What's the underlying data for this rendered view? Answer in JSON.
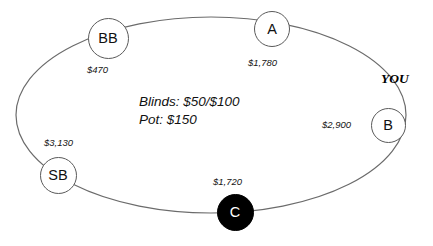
{
  "diagram": {
    "type": "poker-table",
    "background_color": "#ffffff",
    "table_outline_color": "#6b6b6b",
    "center_info": {
      "blinds_line": "Blinds: $50/$100",
      "pot_line": "Pot: $150",
      "blinds_small": "$50",
      "blinds_big": "$100",
      "pot_amount": "$150"
    },
    "hero_marker": {
      "label": "YOU",
      "seat": "B"
    },
    "seats": [
      {
        "id": "bb",
        "label": "BB",
        "stack": "$470",
        "fill": "#ffffff",
        "text_color": "#111111",
        "is_hero": false,
        "is_dealer": false,
        "cx": 108,
        "cy": 38,
        "d": 41,
        "font_size": 14.5,
        "stack_x": 87,
        "stack_y": 65
      },
      {
        "id": "a",
        "label": "A",
        "stack": "$1,780",
        "fill": "#ffffff",
        "text_color": "#111111",
        "is_hero": false,
        "is_dealer": false,
        "cx": 272,
        "cy": 29,
        "d": 36,
        "font_size": 14.5,
        "stack_x": 248,
        "stack_y": 58
      },
      {
        "id": "b",
        "label": "B",
        "stack": "$2,900",
        "fill": "#ffffff",
        "text_color": "#111111",
        "is_hero": true,
        "is_dealer": false,
        "cx": 388,
        "cy": 125,
        "d": 35,
        "font_size": 14.5,
        "stack_x": 322,
        "stack_y": 120
      },
      {
        "id": "sb",
        "label": "SB",
        "stack": "$3,130",
        "fill": "#ffffff",
        "text_color": "#111111",
        "is_hero": false,
        "is_dealer": false,
        "cx": 58,
        "cy": 175,
        "d": 37,
        "font_size": 14.5,
        "stack_x": 44,
        "stack_y": 138
      },
      {
        "id": "c",
        "label": "C",
        "stack": "$1,720",
        "fill": "#000000",
        "text_color": "#ffffff",
        "is_hero": false,
        "is_dealer": true,
        "cx": 235,
        "cy": 212,
        "d": 37,
        "font_size": 14.5,
        "stack_x": 213,
        "stack_y": 177
      }
    ],
    "table_ellipse": {
      "cx": 211,
      "cy": 115,
      "rx": 195,
      "ry": 98
    }
  }
}
